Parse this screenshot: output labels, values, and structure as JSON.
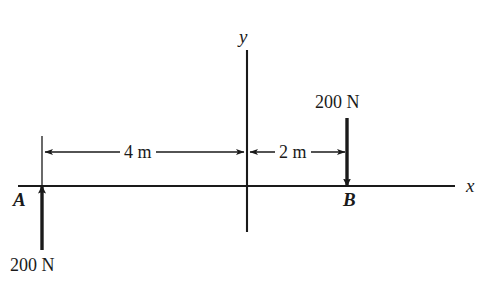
{
  "figure": {
    "background_color": "#ffffff",
    "stroke_color": "#1a1a1a",
    "width": 494,
    "height": 301
  },
  "axes": {
    "x_label": "x",
    "y_label": "y",
    "origin_x_px": 247,
    "origin_y_px": 186,
    "x_axis_start_px": 18,
    "x_axis_end_px": 455,
    "y_axis_top_px": 50,
    "y_axis_bottom_px": 232
  },
  "points": [
    {
      "name": "A",
      "label": "A",
      "x_px": 42,
      "position_m": -4,
      "label_side": "left"
    },
    {
      "name": "B",
      "label": "B",
      "x_px": 347,
      "position_m": 2,
      "label_side": "below"
    }
  ],
  "forces": [
    {
      "name": "force-at-A",
      "label": "200 N",
      "magnitude": 200,
      "unit": "N",
      "direction": "up",
      "applied_at": "A",
      "x_px": 42,
      "tail_y_px": 250,
      "head_y_px": 186
    },
    {
      "name": "force-at-B",
      "label": "200 N",
      "magnitude": 200,
      "unit": "N",
      "direction": "down",
      "applied_at": "B",
      "x_px": 347,
      "tail_y_px": 118,
      "head_y_px": 186
    }
  ],
  "dimensions": [
    {
      "name": "dimension-4m",
      "label": "4 m",
      "value": 4,
      "unit": "m",
      "from_px": 42,
      "to_px": 247,
      "y_px": 152
    },
    {
      "name": "dimension-2m",
      "label": "2 m",
      "value": 2,
      "unit": "m",
      "from_px": 247,
      "to_px": 347,
      "y_px": 152
    }
  ]
}
